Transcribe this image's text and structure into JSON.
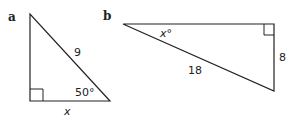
{
  "diagram": {
    "triangles": [
      {
        "part_label": "a",
        "hypotenuse_label": "9",
        "angle_label": "50°",
        "base_label": "x",
        "right_angle_position": "bottom-left"
      },
      {
        "part_label": "b",
        "hypotenuse_label": "18",
        "side_label": "8",
        "angle_label": "x°",
        "right_angle_position": "top-right"
      }
    ],
    "stroke_color": "#222222"
  }
}
